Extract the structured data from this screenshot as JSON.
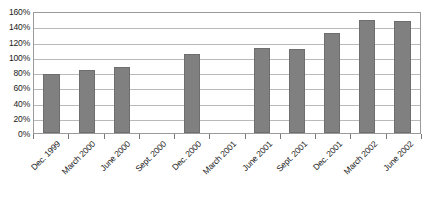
{
  "chart_data": {
    "type": "bar",
    "title": "",
    "xlabel": "",
    "ylabel": "",
    "categories": [
      "Dec. 1999",
      "March 2000",
      "June 2000",
      "Sept. 2000",
      "Dec. 2000",
      "March 2001",
      "June 2001",
      "Sept. 2001",
      "Dec. 2001",
      "March 2002",
      "June 2002"
    ],
    "values": [
      78,
      83,
      87,
      null,
      103,
      null,
      112,
      110,
      131,
      148,
      147
    ],
    "value_labels": [
      "78%",
      "83%",
      "87%",
      "",
      "103%",
      "",
      "112%",
      "110%",
      "131%",
      "148%",
      "147%"
    ],
    "ylim": [
      0,
      160
    ],
    "ytick_values": [
      0,
      20,
      40,
      60,
      80,
      100,
      120,
      140,
      160
    ],
    "ytick_labels": [
      "0%",
      "20%",
      "40%",
      "60%",
      "80%",
      "100%",
      "120%",
      "140%",
      "160%"
    ],
    "grid": true,
    "grid_axis": "y",
    "legend": false,
    "legend_position": "none",
    "bar_color": "#808080",
    "bar_border_color": "#6e6e6e",
    "gridline_color": "#b9b9b9",
    "frame_color": "#9a9a9a",
    "background_color": "#ffffff",
    "text_color": "#1a1a1a",
    "xtick_label_rotation": -45
  }
}
